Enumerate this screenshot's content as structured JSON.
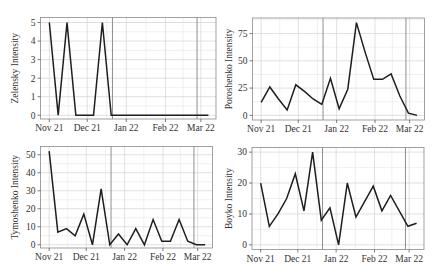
{
  "figure": {
    "layout": "2x2 grid of line charts",
    "colors": {
      "background": "#ffffff",
      "panel_background": "#ffffff",
      "line": "#1e1e1e",
      "grid_major": "#d2d2d2",
      "grid_minor": "#e6e6e6",
      "reference_line": "#8f8f8f",
      "border": "#8a8a8a",
      "text": "#333333"
    }
  },
  "chart_data": [
    {
      "type": "line",
      "title": "",
      "xlabel": "",
      "ylabel": "Zelensky Intensity",
      "x": [
        "2021-11-01",
        "2021-11-08",
        "2021-11-15",
        "2021-11-22",
        "2021-11-29",
        "2021-12-06",
        "2021-12-13",
        "2021-12-20",
        "2021-12-27",
        "2022-01-03",
        "2022-01-10",
        "2022-01-17",
        "2022-01-24",
        "2022-01-31",
        "2022-02-07",
        "2022-02-14",
        "2022-02-21",
        "2022-02-28",
        "2022-03-07"
      ],
      "values": [
        5,
        0,
        5,
        0,
        0,
        0,
        5,
        0,
        0,
        0,
        0,
        0,
        0,
        0,
        0,
        0,
        0,
        0,
        0
      ],
      "xticks": [
        {
          "label": "Nov 21",
          "date": "2021-11-01"
        },
        {
          "label": "Dec 21",
          "date": "2021-12-01"
        },
        {
          "label": "Jan 22",
          "date": "2022-01-01"
        },
        {
          "label": "Feb 22",
          "date": "2022-02-01"
        },
        {
          "label": "Mar 22",
          "date": "2022-03-01"
        }
      ],
      "yticks": [
        0,
        1,
        2,
        3,
        4,
        5
      ],
      "ylim": [
        -0.2,
        5.27
      ],
      "xlim": [
        "2021-10-25",
        "2022-03-13"
      ],
      "reference_lines": [
        "2021-12-21",
        "2022-02-26"
      ],
      "grid": true,
      "legend": null
    },
    {
      "type": "line",
      "title": "",
      "xlabel": "",
      "ylabel": "Poroshenko Intensity",
      "x": [
        "2021-11-01",
        "2021-11-08",
        "2021-11-15",
        "2021-11-22",
        "2021-11-29",
        "2021-12-06",
        "2021-12-13",
        "2021-12-20",
        "2021-12-27",
        "2022-01-03",
        "2022-01-10",
        "2022-01-17",
        "2022-01-24",
        "2022-01-31",
        "2022-02-07",
        "2022-02-14",
        "2022-02-21",
        "2022-02-28",
        "2022-03-07"
      ],
      "values": [
        12,
        26,
        15,
        5,
        28,
        22,
        15,
        10,
        34,
        6,
        24,
        85,
        58,
        33,
        33,
        38,
        18,
        2,
        0
      ],
      "xticks": [
        {
          "label": "Nov 21",
          "date": "2021-11-01"
        },
        {
          "label": "Dec 21",
          "date": "2021-12-01"
        },
        {
          "label": "Jan 22",
          "date": "2022-01-01"
        },
        {
          "label": "Feb 22",
          "date": "2022-02-01"
        },
        {
          "label": "Mar 22",
          "date": "2022-03-01"
        }
      ],
      "yticks": [
        0,
        25,
        50,
        75
      ],
      "ylim": [
        -4.25,
        89.25
      ],
      "xlim": [
        "2021-10-25",
        "2022-03-13"
      ],
      "reference_lines": [
        "2021-12-21",
        "2022-02-26"
      ],
      "grid": true,
      "legend": null
    },
    {
      "type": "line",
      "title": "",
      "xlabel": "",
      "ylabel": "Tymoshenko Intensity",
      "x": [
        "2021-11-01",
        "2021-11-08",
        "2021-11-15",
        "2021-11-22",
        "2021-11-29",
        "2021-12-06",
        "2021-12-13",
        "2021-12-20",
        "2021-12-27",
        "2022-01-03",
        "2022-01-10",
        "2022-01-17",
        "2022-01-24",
        "2022-01-31",
        "2022-02-07",
        "2022-02-14",
        "2022-02-21",
        "2022-02-28",
        "2022-03-07"
      ],
      "values": [
        52,
        7,
        9,
        5,
        17,
        0,
        31,
        0,
        6,
        0,
        9,
        0,
        14,
        2,
        2,
        14,
        2,
        0,
        0
      ],
      "xticks": [
        {
          "label": "Nov 21",
          "date": "2021-11-01"
        },
        {
          "label": "Dec 21",
          "date": "2021-12-01"
        },
        {
          "label": "Jan 22",
          "date": "2022-01-01"
        },
        {
          "label": "Feb 22",
          "date": "2022-02-01"
        },
        {
          "label": "Mar 22",
          "date": "2022-03-01"
        }
      ],
      "yticks": [
        0,
        10,
        20,
        30,
        40,
        50
      ],
      "ylim": [
        -1.8,
        54.6
      ],
      "xlim": [
        "2021-10-25",
        "2022-03-13"
      ],
      "reference_lines": [
        "2021-12-21",
        "2022-02-26"
      ],
      "grid": true,
      "legend": null
    },
    {
      "type": "line",
      "title": "",
      "xlabel": "",
      "ylabel": "Boyko Intensity",
      "x": [
        "2021-11-01",
        "2021-11-08",
        "2021-11-15",
        "2021-11-22",
        "2021-11-29",
        "2021-12-06",
        "2021-12-13",
        "2021-12-20",
        "2021-12-27",
        "2022-01-03",
        "2022-01-10",
        "2022-01-17",
        "2022-01-24",
        "2022-01-31",
        "2022-02-07",
        "2022-02-14",
        "2022-02-21",
        "2022-02-28",
        "2022-03-07"
      ],
      "values": [
        20,
        6,
        10,
        15,
        23,
        11,
        30,
        8,
        12,
        0,
        20,
        9,
        14,
        19,
        11,
        16,
        11,
        6,
        7
      ],
      "xticks": [
        {
          "label": "Nov 21",
          "date": "2021-11-01"
        },
        {
          "label": "Dec 21",
          "date": "2021-12-01"
        },
        {
          "label": "Jan 22",
          "date": "2022-01-01"
        },
        {
          "label": "Feb 22",
          "date": "2022-02-01"
        },
        {
          "label": "Mar 22",
          "date": "2022-03-01"
        }
      ],
      "yticks": [
        0,
        10,
        20,
        30
      ],
      "ylim": [
        -1.5,
        31.5
      ],
      "xlim": [
        "2021-10-25",
        "2022-03-13"
      ],
      "reference_lines": [
        "2021-12-21",
        "2022-02-26"
      ],
      "grid": true,
      "legend": null
    }
  ]
}
